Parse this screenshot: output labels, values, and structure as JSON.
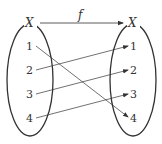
{
  "diagram": {
    "function_label": "f",
    "domain": {
      "label": "X",
      "elements": [
        "1",
        "2",
        "3",
        "4"
      ]
    },
    "codomain": {
      "label": "X",
      "elements": [
        "1",
        "2",
        "3",
        "4"
      ]
    },
    "mapping": [
      {
        "from": "1",
        "to": "4"
      },
      {
        "from": "2",
        "to": "1"
      },
      {
        "from": "3",
        "to": "2"
      },
      {
        "from": "4",
        "to": "3"
      }
    ]
  }
}
